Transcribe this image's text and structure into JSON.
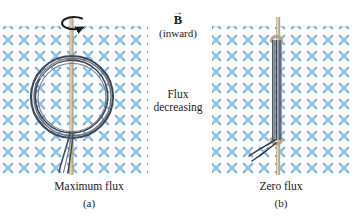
{
  "figure": {
    "cutoff_top_text": "",
    "field": {
      "symbol_glyph": "×",
      "color": "#63ace0",
      "meaning": "magnetic field directed into the page",
      "spacing_x": 16,
      "spacing_y": 16,
      "panels": [
        {
          "name": "left-field",
          "x": 2,
          "y": 26,
          "width": 146,
          "height": 152
        },
        {
          "name": "right-field",
          "x": 212,
          "y": 26,
          "width": 140,
          "height": 152
        }
      ]
    },
    "b_label": {
      "arrow": "→",
      "symbol": "B",
      "qualifier": "(inward)"
    },
    "center_note": {
      "line1": "Flux",
      "line2": "decreasing"
    },
    "panel_a": {
      "caption": "Maximum flux",
      "letter": "(a)",
      "coil_orientation": "face-on circular loop",
      "rotation_arrow": "counterclockwise",
      "axis_color": "#cbb89a",
      "coil_color": "#4a5464"
    },
    "panel_b": {
      "caption": "Zero flux",
      "letter": "(b)",
      "coil_orientation": "edge-on loop",
      "axis_color": "#cbb89a",
      "coil_color": "#4a5464"
    }
  }
}
